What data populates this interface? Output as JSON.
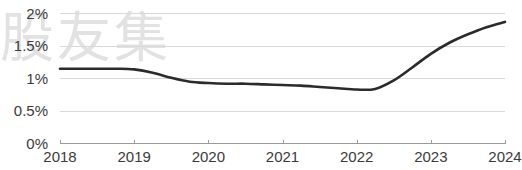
{
  "watermark": {
    "text": "股友集"
  },
  "chart_data": {
    "type": "line",
    "title": "",
    "subtitle": "",
    "xlabel": "",
    "ylabel": "",
    "grid": true,
    "legend": null,
    "legend_position": "none",
    "xlim": [
      2018,
      2024
    ],
    "ylim": [
      0,
      2
    ],
    "x_tick_labels": [
      "2018",
      "2019",
      "2020",
      "2021",
      "2022",
      "2023",
      "2024"
    ],
    "x_ticks": [
      2018,
      2019,
      2020,
      2021,
      2022,
      2023,
      2024
    ],
    "y_tick_labels": [
      "0%",
      "0.5%",
      "1%",
      "1.5%",
      "2%"
    ],
    "y_ticks": [
      0,
      0.5,
      1,
      1.5,
      2
    ],
    "series": [
      {
        "name": "",
        "color": "#2b2b2b",
        "x": [
          2018.0,
          2018.25,
          2018.5,
          2018.75,
          2019.0,
          2019.25,
          2019.5,
          2019.75,
          2020.0,
          2020.25,
          2020.5,
          2020.75,
          2021.0,
          2021.25,
          2021.5,
          2021.75,
          2022.0,
          2022.25,
          2022.5,
          2022.75,
          2023.0,
          2023.25,
          2023.5,
          2023.75,
          2024.0
        ],
        "values": [
          1.15,
          1.15,
          1.15,
          1.15,
          1.14,
          1.09,
          1.01,
          0.95,
          0.93,
          0.92,
          0.92,
          0.91,
          0.9,
          0.89,
          0.87,
          0.85,
          0.83,
          0.84,
          0.97,
          1.17,
          1.38,
          1.55,
          1.68,
          1.79,
          1.87
        ]
      }
    ]
  },
  "axis": {
    "line_color": "#9a9a9a",
    "grid_color": "#d9d9d9",
    "tick_color": "#3a3a3a"
  }
}
